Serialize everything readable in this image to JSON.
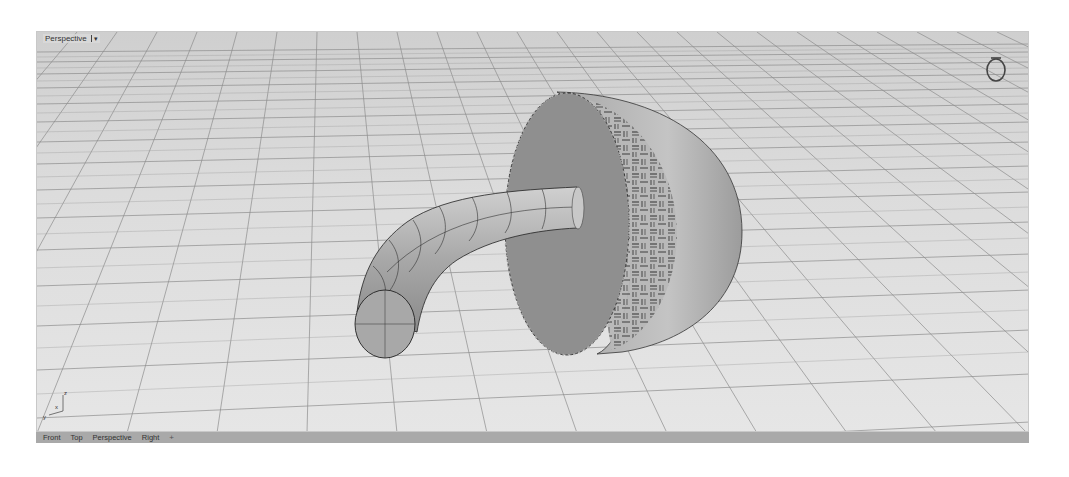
{
  "viewport": {
    "title": "Perspective",
    "menu_arrow": "▾",
    "background_color": "#d9d9d9",
    "grid_color": "#8c8c8c",
    "axes": {
      "x": "x",
      "y": "y",
      "z": "z"
    }
  },
  "scene": {
    "objects": [
      {
        "name": "curved-pipe",
        "color": "#b5b5b5"
      },
      {
        "name": "textured-cylinder",
        "color": "#9a9a9a"
      }
    ]
  },
  "tabs": [
    {
      "label": "Front"
    },
    {
      "label": "Top"
    },
    {
      "label": "Perspective"
    },
    {
      "label": "Right"
    }
  ],
  "tab_add": "+"
}
